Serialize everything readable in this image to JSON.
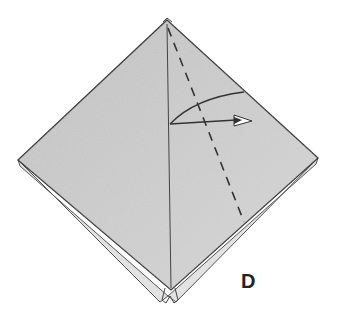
{
  "diagram": {
    "step_label": "D",
    "paper_color": "#c8c8c8",
    "line_color": "#333333",
    "elements": [
      {
        "type": "paper-kite",
        "description": "diamond-shaped folded paper"
      },
      {
        "type": "valley-fold-line",
        "style": "dashed"
      },
      {
        "type": "fold-arrow",
        "direction": "right"
      },
      {
        "type": "center-crease"
      }
    ]
  }
}
